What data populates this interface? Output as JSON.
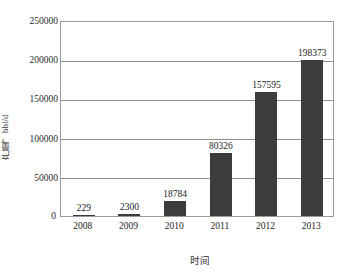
{
  "chart_data": {
    "type": "bar",
    "title": "",
    "subtitle": "",
    "xlabel": "时间",
    "ylabel": "产量，bbl/d",
    "categories": [
      "2008",
      "2009",
      "2010",
      "2011",
      "2012",
      "2013"
    ],
    "values": [
      229,
      2300,
      18784,
      80326,
      157595,
      198373
    ],
    "data_labels": [
      "229",
      "2300",
      "18784",
      "80326",
      "157595",
      "198373"
    ],
    "series": [
      {
        "name": "产量",
        "values": [
          229,
          2300,
          18784,
          80326,
          157595,
          198373
        ]
      }
    ],
    "ylim": [
      0,
      250000
    ],
    "ytick_step": 50000,
    "ytick_labels": [
      "0",
      "50000",
      "100000",
      "150000",
      "200000",
      "250000"
    ],
    "ytick_values": [
      0,
      50000,
      100000,
      150000,
      200000,
      250000
    ],
    "xlim_categories": 6,
    "grid": "horizontal",
    "legend": "none",
    "legend_position": "none",
    "bar_color": "#3c3c3c",
    "plot_background": "#ffffff",
    "axis_color": "#9a9a9a",
    "gridline_color": "#8f8f8f",
    "text_color": "#232323"
  }
}
